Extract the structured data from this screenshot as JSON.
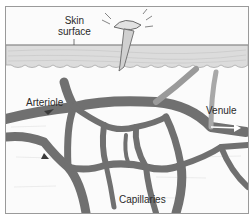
{
  "diagram": {
    "labels": {
      "skin_surface_line1": "Skin",
      "skin_surface_line2": "surface",
      "arteriole": "Arteriole",
      "venule": "Venule",
      "capillaries": "Capillaries"
    },
    "colors": {
      "background": "#fbfbfb",
      "skin_layer": "#d9d9d9",
      "vessel": "#6f6f6f",
      "vessel_dark": "#4a4a4a",
      "border": "#9a9a9a",
      "text": "#2a2a2a"
    }
  }
}
